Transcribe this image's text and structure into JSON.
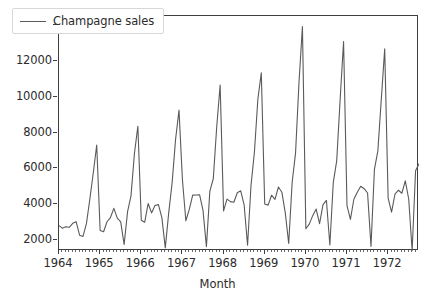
{
  "chart_data": {
    "type": "line",
    "title": "",
    "xlabel": "Month",
    "ylabel": "",
    "grid": false,
    "legend_position": "upper left",
    "xlim": [
      1964.0,
      1972.75
    ],
    "ylim": [
      1400,
      14500
    ],
    "x_tick_labels": [
      "1964",
      "1965",
      "1966",
      "1967",
      "1968",
      "1969",
      "1970",
      "1971",
      "1972"
    ],
    "x_tick_values": [
      1964,
      1965,
      1966,
      1967,
      1968,
      1969,
      1970,
      1971,
      1972
    ],
    "x_minor_ticks_per_interval": 12,
    "y_tick_labels": [
      "2000",
      "4000",
      "6000",
      "8000",
      "10000",
      "12000",
      "14000"
    ],
    "y_tick_values": [
      2000,
      4000,
      6000,
      8000,
      10000,
      12000,
      14000
    ],
    "series": [
      {
        "name": "Champagne sales",
        "color": "#5a5a5a",
        "line_width": 1.1,
        "x_start": 1964.0,
        "x_step": 0.08333333,
        "values": [
          2815,
          2672,
          2755,
          2721,
          2946,
          3036,
          2282,
          2212,
          2922,
          4301,
          5764,
          7312,
          2541,
          2475,
          3031,
          3266,
          3776,
          3230,
          3028,
          1759,
          3595,
          4474,
          6838,
          8357,
          3113,
          3006,
          4047,
          3523,
          3937,
          3986,
          3260,
          1573,
          3528,
          5211,
          7614,
          9254,
          5375,
          3088,
          3718,
          4514,
          4520,
          4539,
          3663,
          1643,
          4739,
          5428,
          8314,
          10651,
          3633,
          4292,
          4154,
          4121,
          4647,
          4753,
          3965,
          1723,
          5048,
          6922,
          9858,
          11331,
          4016,
          3957,
          4510,
          4276,
          4968,
          4677,
          3523,
          1821,
          5222,
          6872,
          10803,
          13916,
          2639,
          2899,
          3370,
          3740,
          2927,
          3986,
          4217,
          1738,
          5221,
          6424,
          9842,
          13076,
          3934,
          3162,
          4286,
          4676,
          5010,
          4874,
          4633,
          1659,
          5951,
          6981,
          9851,
          12670,
          4348,
          3564,
          4577,
          4788,
          4618,
          5312,
          4298,
          1413,
          5877,
          6266
        ]
      }
    ]
  },
  "legend": {
    "entries": [
      {
        "label": "Champagne sales"
      }
    ]
  },
  "axes": {
    "x_axis_label": "Month"
  }
}
